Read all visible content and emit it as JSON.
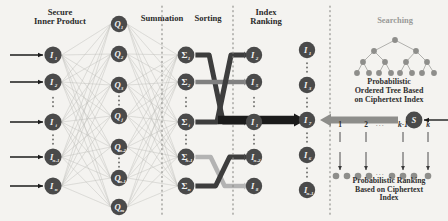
{
  "figure": {
    "background_color": "#f4f3f0",
    "node_color": "#4a4a4a",
    "node_text_color": "#f2f2f2",
    "edge_color": "#b9b8b4",
    "divider_color": "#8a8a86",
    "ribbon_dark": "#3d3d3d",
    "ribbon_mid": "#808080",
    "ribbon_light": "#b3b3b3",
    "arrow_color": "#1b1b1b",
    "searching_color": "#9a9a98",
    "caption_color": "#2f2f2f"
  },
  "headers": {
    "secure_inner_product": "Secure\nInner Product",
    "summation": "Summation",
    "sorting": "Sorting",
    "index_ranking": "Index\nRanking",
    "searching": "Searching"
  },
  "captions": {
    "tree": "Probabilistic\nOrdered Tree Based\non Ciphertext Index",
    "ranking": "Probabilistic Ranking\nBased on Ciphertext\nIndex"
  },
  "columns": {
    "input": {
      "name": "secure-inner-product-nodes",
      "nodes": [
        {
          "label": "I",
          "sub": "1",
          "y": 55
        },
        {
          "label": "I",
          "sub": "2",
          "y": 82
        },
        {
          "label": "I",
          "sub": "i",
          "y": 122
        },
        {
          "label": "I",
          "sub": "n-1",
          "y": 157
        },
        {
          "label": "I",
          "sub": "n",
          "y": 186
        }
      ],
      "x": 53,
      "has_input_arrows": true,
      "ellipses_after": [
        1,
        2
      ]
    },
    "query": {
      "name": "query-nodes",
      "x": 119,
      "nodes": [
        {
          "label": "Q",
          "sub": "1",
          "y": 24
        },
        {
          "label": "Q",
          "sub": "2",
          "y": 54
        },
        {
          "label": "Q",
          "sub": "3",
          "y": 85
        },
        {
          "label": "Q",
          "sub": "j",
          "y": 116
        },
        {
          "label": "Q",
          "sub": "m-2",
          "y": 147
        },
        {
          "label": "Q",
          "sub": "m-1",
          "y": 178
        },
        {
          "label": "Q",
          "sub": "m",
          "y": 207
        }
      ],
      "ellipses_after": [
        2,
        4
      ]
    },
    "summation": {
      "name": "summation-nodes",
      "x": 186,
      "nodes": [
        {
          "label": "Σ",
          "sub": "1",
          "y": 55
        },
        {
          "label": "Σ",
          "sub": "2",
          "y": 82
        },
        {
          "label": "Σ",
          "sub": "i",
          "y": 122
        },
        {
          "label": "Σ",
          "sub": "n-1",
          "y": 157
        },
        {
          "label": "Σ",
          "sub": "n",
          "y": 186
        }
      ],
      "ellipses_after": [
        1,
        2
      ]
    },
    "ranking": {
      "name": "index-ranking-nodes",
      "x": 254,
      "nodes": [
        {
          "label": "I",
          "sub": "2",
          "y": 55
        },
        {
          "label": "I",
          "sub": "5",
          "y": 82
        },
        {
          "label": "I",
          "sub": "1",
          "y": 122
        },
        {
          "label": "I",
          "sub": "n-2",
          "y": 157
        },
        {
          "label": "I",
          "sub": "8",
          "y": 186
        }
      ],
      "ellipses_after": [
        1,
        2
      ]
    },
    "result": {
      "name": "result-nodes",
      "x": 307,
      "nodes": [
        {
          "label": "I",
          "sub": "1",
          "y": 50
        },
        {
          "label": "I",
          "sub": "3",
          "y": 85
        },
        {
          "label": "I",
          "sub": "7",
          "y": 120
        },
        {
          "label": "I",
          "sub": "6",
          "y": 155
        },
        {
          "label": "I",
          "sub": "n-1",
          "y": 190
        }
      ],
      "ellipses_after": [
        0,
        1,
        2,
        3
      ]
    }
  },
  "server": {
    "name": "server-node",
    "label": "S",
    "x": 414,
    "y": 120
  },
  "tree": {
    "name": "probabilistic-ordered-tree",
    "root": {
      "x": 395,
      "y": 40
    },
    "level2": [
      {
        "x": 374,
        "y": 51
      },
      {
        "x": 416,
        "y": 51
      }
    ],
    "level3": [
      {
        "x": 363,
        "y": 62
      },
      {
        "x": 385,
        "y": 62
      },
      {
        "x": 406,
        "y": 62
      },
      {
        "x": 427,
        "y": 62
      }
    ],
    "leaves": [
      {
        "x": 357,
        "y": 73
      },
      {
        "x": 369,
        "y": 73
      },
      {
        "x": 379,
        "y": 73
      },
      {
        "x": 391,
        "y": 73
      },
      {
        "x": 400,
        "y": 73
      },
      {
        "x": 412,
        "y": 73
      },
      {
        "x": 422,
        "y": 73
      },
      {
        "x": 434,
        "y": 73
      }
    ]
  },
  "ranking_strip": {
    "name": "probabilistic-ranking-strip",
    "labels": [
      "1",
      "2",
      "k-1",
      "k"
    ],
    "ellipsis": "···",
    "label_positions": [
      340,
      366,
      403,
      428
    ],
    "arrow_y_top": 152,
    "arrow_y_bottom": 170,
    "dots": [
      {
        "x": 336
      },
      {
        "x": 347
      },
      {
        "x": 358
      },
      {
        "x": 369
      },
      {
        "x": 392
      },
      {
        "x": 403
      },
      {
        "x": 414
      },
      {
        "x": 428
      }
    ],
    "dots_ellipsis_x": 380
  },
  "dividers": [
    {
      "name": "divider-summation-sorting",
      "x": 162
    },
    {
      "name": "divider-sorting-ranking",
      "x": 233
    },
    {
      "name": "divider-ranking-searching",
      "x": 330
    }
  ],
  "flows": {
    "main_arrow": {
      "name": "main-flow-arrow",
      "from_x": 262,
      "to_x": 306,
      "y": 120
    },
    "server_arrow": {
      "name": "server-to-result-arrow",
      "from_x": 398,
      "to_x": 320,
      "y": 120
    },
    "server_input_arrow": {
      "name": "external-query-arrow",
      "from_x": 448,
      "to_x": 424,
      "y": 120
    }
  }
}
